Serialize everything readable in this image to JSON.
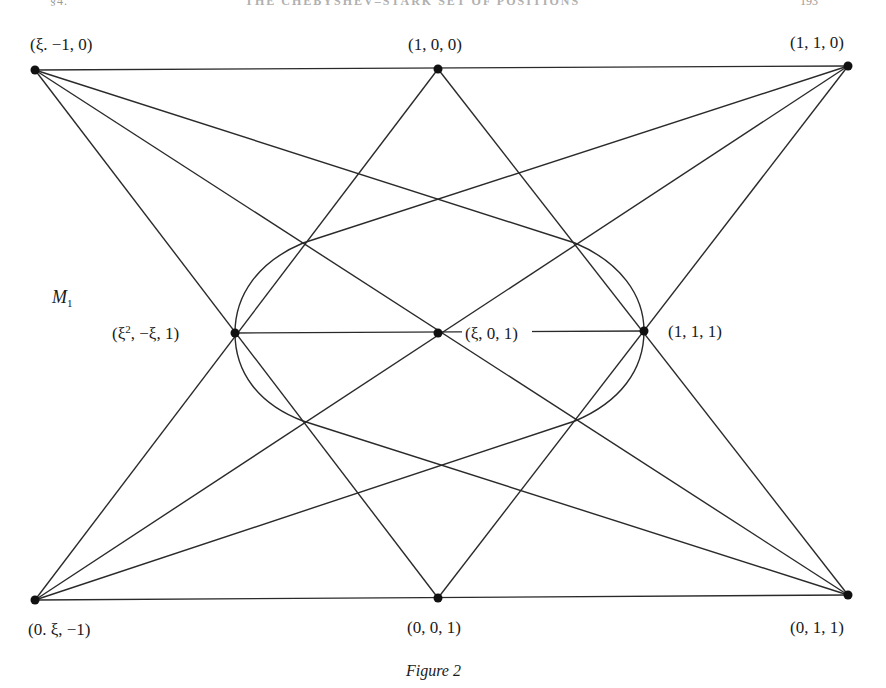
{
  "page_header": {
    "left": "§4.",
    "center": "THE CHEBYSHEV–STARK SET OF POSITIONS",
    "right": "193"
  },
  "figure": {
    "caption": "Figure 2",
    "region_label": {
      "main": "M",
      "sub": "1"
    },
    "points": [
      {
        "id": "A",
        "label": "(ξ. −1, 0)",
        "x": 35,
        "y": 70
      },
      {
        "id": "B",
        "label": "(1, 0, 0)",
        "x": 438,
        "y": 69
      },
      {
        "id": "C",
        "label": "(1, 1, 0)",
        "x": 848,
        "y": 66
      },
      {
        "id": "D",
        "label_base": "(ξ",
        "label_sup": "2",
        "label_rest": ", −ξ, 1)",
        "x": 235,
        "y": 333
      },
      {
        "id": "E",
        "label": "(ξ, 0, 1)",
        "x": 438,
        "y": 333
      },
      {
        "id": "F",
        "label": "(1, 1, 1)",
        "x": 644,
        "y": 331
      },
      {
        "id": "G",
        "label": "(0. ξ, −1)",
        "x": 35,
        "y": 600
      },
      {
        "id": "H",
        "label": "(0, 0, 1)",
        "x": 438,
        "y": 598
      },
      {
        "id": "I",
        "label": "(0, 1, 1)",
        "x": 848,
        "y": 595
      }
    ],
    "lines": [
      [
        "A",
        "B",
        "C"
      ],
      [
        "G",
        "H",
        "I"
      ],
      [
        "D",
        "E",
        "F"
      ],
      [
        "A",
        "E",
        "I"
      ],
      [
        "C",
        "E",
        "G"
      ],
      [
        "A",
        "D",
        "H"
      ],
      [
        "B",
        "D",
        "G"
      ],
      [
        "B",
        "F",
        "I"
      ],
      [
        "C",
        "F",
        "H"
      ]
    ],
    "conic": "oval through D and F with tangent lines from A, C, G, I"
  }
}
